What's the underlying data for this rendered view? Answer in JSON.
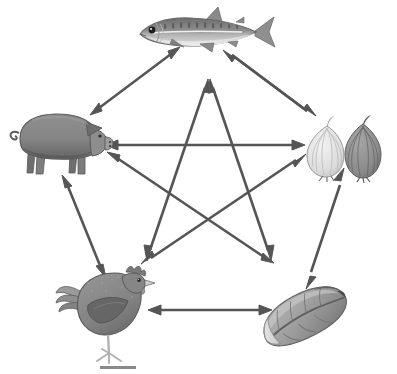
{
  "figure": {
    "title": "Pentagonal food-item relationship network",
    "background_color": "#ffffff",
    "width": 397,
    "height": 374
  },
  "style": {
    "arrow_color": "#555555",
    "arrow_stroke_width": 2.6,
    "arrow_head_length": 13,
    "arrow_head_width": 9,
    "scalebar_color": "#8a8a8a"
  },
  "nodes": [
    {
      "id": "fish",
      "label": "fish",
      "icon_name": "mackerel-fish-icon",
      "x": 198,
      "y": 33,
      "colors": {
        "back": "#7d7d7d",
        "mid": "#a8a8a8",
        "belly": "#d6d6d6",
        "fin": "#8e8e8e",
        "outline": "#6a6a6a",
        "eye": "#1c1c1c"
      }
    },
    {
      "id": "pig",
      "label": "pig",
      "icon_name": "pig-icon",
      "x": 58,
      "y": 142,
      "colors": {
        "body": "#878787",
        "belly": "#5e5e5e",
        "ear": "#6f6f6f",
        "snout": "#9a9a9a",
        "outline": "#5a5a5a",
        "eye": "#2a2a2a"
      }
    },
    {
      "id": "onion",
      "label": "onion",
      "icon_name": "onion-icon",
      "x": 345,
      "y": 148,
      "colors": {
        "light_bulb": "#e2e2e2",
        "light_line": "#b9b9b9",
        "dark_bulb": "#8d8d8d",
        "dark_line": "#6b6b6b",
        "outline": "#707070",
        "root": "#4f4f4f"
      }
    },
    {
      "id": "chicken",
      "label": "chicken",
      "icon_name": "chicken-hen-icon",
      "x": 108,
      "y": 305,
      "colors": {
        "body": "#8a8a8a",
        "wing": "#6b6b6b",
        "tail": "#9b9b9b",
        "comb": "#787878",
        "beak": "#c8c8c8",
        "leg": "#b0b0b0",
        "outline": "#5a5a5a",
        "eye": "#2a2a2a"
      }
    },
    {
      "id": "cabbage",
      "label": "cabbage",
      "icon_name": "napa-cabbage-icon",
      "x": 305,
      "y": 315,
      "colors": {
        "leaf": "#9d9d9d",
        "leaf_dark": "#767676",
        "leaf_light": "#d8d8d8",
        "stem": "#e4e4e4",
        "outline": "#6e6e6e"
      }
    }
  ],
  "edges": [
    {
      "id": "fish-pig",
      "from": "fish",
      "to": "pig",
      "kind": "perimeter",
      "double_headed": true
    },
    {
      "id": "fish-onion",
      "from": "fish",
      "to": "onion",
      "kind": "perimeter",
      "double_headed": true
    },
    {
      "id": "pig-onion",
      "from": "pig",
      "to": "onion",
      "kind": "perimeter",
      "double_headed": true
    },
    {
      "id": "pig-chicken",
      "from": "pig",
      "to": "chicken",
      "kind": "perimeter",
      "double_headed": true
    },
    {
      "id": "onion-cabbage",
      "from": "onion",
      "to": "cabbage",
      "kind": "perimeter",
      "double_headed": true
    },
    {
      "id": "chicken-cabbage",
      "from": "chicken",
      "to": "cabbage",
      "kind": "perimeter",
      "double_headed": true
    },
    {
      "id": "fish-chicken",
      "from": "fish",
      "to": "chicken",
      "kind": "diagonal",
      "double_headed": true
    },
    {
      "id": "fish-cabbage",
      "from": "fish",
      "to": "cabbage",
      "kind": "diagonal",
      "double_headed": true
    },
    {
      "id": "pig-cabbage",
      "from": "pig",
      "to": "cabbage",
      "kind": "diagonal",
      "double_headed": true
    },
    {
      "id": "onion-chicken",
      "from": "onion",
      "to": "chicken",
      "kind": "diagonal",
      "double_headed": true
    }
  ],
  "scalebar": {
    "label": "",
    "x": 100,
    "y": 366,
    "width": 36,
    "height": 3
  }
}
